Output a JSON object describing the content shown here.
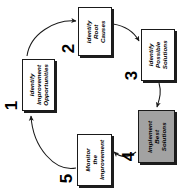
{
  "diagram": {
    "type": "cycle-flow",
    "orientation": "rotated-90-ccw",
    "background_color": "#ffffff",
    "line_color": "#1a1a1a",
    "highlight_fill": "#a2a2a2",
    "box_fill": "#ffffff",
    "steps": [
      {
        "number": "1",
        "line1": "Identify",
        "line2": "Improvement",
        "line3": "Opportunities",
        "highlighted": false
      },
      {
        "number": "2",
        "line1": "Identify",
        "line2": "Root",
        "line3": "Causes",
        "highlighted": false
      },
      {
        "number": "3",
        "line1": "Identify",
        "line2": "Possible",
        "line3": "Solutions",
        "highlighted": false
      },
      {
        "number": "4",
        "line1": "Implement",
        "line2": "Best",
        "line3": "Solutions",
        "highlighted": true
      },
      {
        "number": "5",
        "line1": "Monitor",
        "line2": "the",
        "line3": "Improvement",
        "highlighted": false
      }
    ],
    "connectors": [
      {
        "from": "1",
        "to": "2",
        "style": "curved-arrow"
      },
      {
        "from": "2",
        "to": "3",
        "style": "curved-arrow"
      },
      {
        "from": "3",
        "to": "4",
        "style": "curved-arrow"
      },
      {
        "from": "4",
        "to": "5",
        "style": "curved-arrow"
      },
      {
        "from": "5",
        "to": "1",
        "style": "curved-arrow"
      }
    ]
  }
}
